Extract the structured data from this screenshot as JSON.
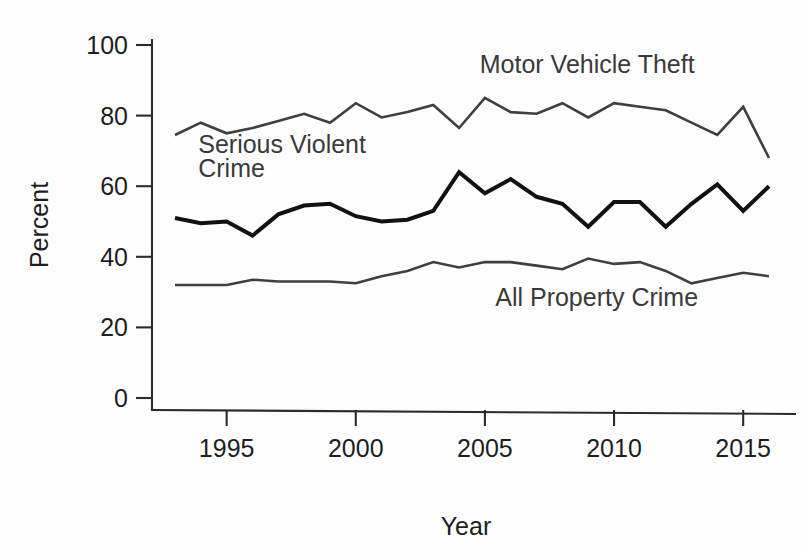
{
  "chart_data": {
    "type": "line",
    "title": "",
    "subtitle": "",
    "xlabel": "Year",
    "ylabel": "Percent",
    "grid": false,
    "legend_position": "inline-annotations",
    "xlim": [
      1993,
      2016
    ],
    "ylim": [
      0,
      100
    ],
    "x": [
      1993,
      1994,
      1995,
      1996,
      1997,
      1998,
      1999,
      2000,
      2001,
      2002,
      2003,
      2004,
      2005,
      2006,
      2007,
      2008,
      2009,
      2010,
      2011,
      2012,
      2013,
      2014,
      2015,
      2016
    ],
    "x_ticks": [
      1995,
      2000,
      2005,
      2010,
      2015
    ],
    "x_tick_labels": [
      "1995",
      "2000",
      "2005",
      "2010",
      "2015"
    ],
    "y_ticks": [
      0,
      20,
      40,
      60,
      80,
      100
    ],
    "y_tick_labels": [
      "0",
      "20",
      "40",
      "60",
      "80",
      "100"
    ],
    "series": [
      {
        "name": "Motor Vehicle Theft",
        "color": "#3f3f3f",
        "stroke_width": 2.6,
        "label_x": 2005.1,
        "label_y": 91.5,
        "values": [
          74.5,
          78.0,
          75.0,
          76.5,
          78.5,
          80.5,
          78.0,
          83.5,
          79.5,
          81.0,
          83.0,
          76.5,
          85.0,
          81.0,
          80.5,
          83.5,
          79.5,
          83.5,
          82.5,
          81.5,
          78.0,
          74.5,
          82.5,
          68.0
        ]
      },
      {
        "name": "Serious Violent Crime",
        "color": "#111111",
        "stroke_width": 4.0,
        "label_x": 1994.0,
        "label_y": 68.0,
        "values": [
          51.0,
          49.5,
          50.0,
          46.0,
          52.0,
          54.5,
          55.0,
          51.5,
          50.0,
          50.5,
          53.0,
          64.0,
          58.0,
          62.0,
          57.0,
          55.0,
          48.5,
          55.5,
          55.5,
          48.5,
          55.0,
          60.5,
          53.0,
          60.0
        ]
      },
      {
        "name": "All Property Crime",
        "color": "#3f3f3f",
        "stroke_width": 2.6,
        "label_x": 2006.0,
        "label_y": 26.5,
        "values": [
          32.0,
          32.0,
          32.0,
          33.5,
          33.0,
          33.0,
          33.0,
          32.5,
          34.5,
          36.0,
          38.5,
          37.0,
          38.5,
          38.5,
          37.5,
          36.5,
          39.5,
          38.0,
          38.5,
          36.0,
          32.5,
          34.0,
          35.5,
          34.5
        ]
      }
    ],
    "series_tail": {
      "Motor Vehicle Theft": [
        78.5
      ],
      "Serious Violent Crime": [
        54.5,
        53.5,
        50.5
      ],
      "All Property Crime": [
        34.0,
        33.5,
        35.0
      ]
    },
    "annotations": [
      {
        "text": "Motor Vehicle Theft",
        "x": 2004.8,
        "y": 92.0
      },
      {
        "text": "Serious Violent",
        "x": 1993.9,
        "y": 69.5
      },
      {
        "text": "Crime",
        "x": 1993.9,
        "y": 62.5
      },
      {
        "text": "All Property Crime",
        "x": 2005.4,
        "y": 26.0
      }
    ]
  },
  "axes": {
    "y_title": "Percent",
    "x_title": "Year"
  }
}
